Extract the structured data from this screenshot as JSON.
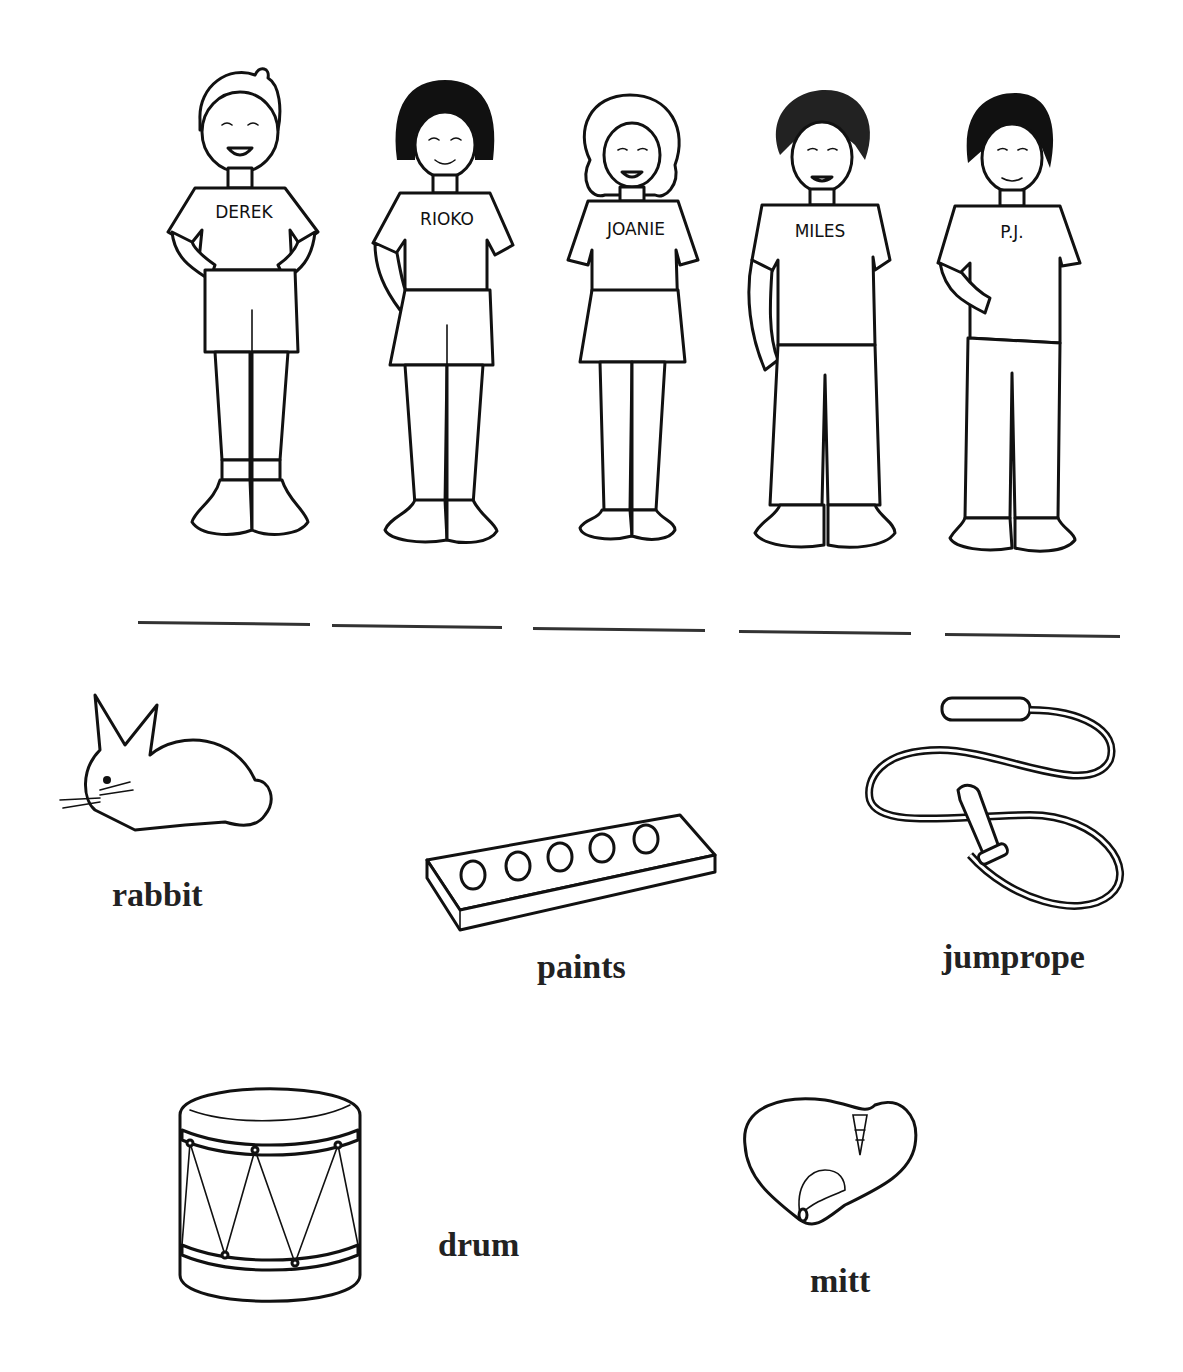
{
  "worksheet": {
    "children": [
      {
        "name": "DEREK",
        "hair": "light",
        "bottom": "shorts"
      },
      {
        "name": "RIOKO",
        "hair": "dark-bob",
        "bottom": "shorts"
      },
      {
        "name": "JOANIE",
        "hair": "curly-light",
        "bottom": "skirt"
      },
      {
        "name": "MILES",
        "hair": "curly-dark",
        "bottom": "pants"
      },
      {
        "name": "P.J.",
        "hair": "dark",
        "bottom": "pants"
      }
    ],
    "answer_lines": [
      {
        "value": ""
      },
      {
        "value": ""
      },
      {
        "value": ""
      },
      {
        "value": ""
      },
      {
        "value": ""
      }
    ],
    "items": [
      {
        "label": "rabbit",
        "icon": "rabbit-icon"
      },
      {
        "label": "paints",
        "icon": "paint-palette-icon"
      },
      {
        "label": "jumprope",
        "icon": "jumprope-icon"
      },
      {
        "label": "drum",
        "icon": "drum-icon"
      },
      {
        "label": "mitt",
        "icon": "baseball-mitt-icon"
      }
    ]
  }
}
